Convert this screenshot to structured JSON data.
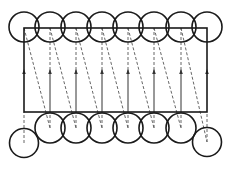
{
  "diagram": {
    "type": "circle-packing-path",
    "stroke_color": "#1a1a1a",
    "background": "#ffffff",
    "circle_radius": 15,
    "column_xs": [
      24,
      50,
      76,
      102,
      128,
      154,
      181,
      207
    ],
    "top_row_y": 27,
    "bottom_row": [
      {
        "x": 24,
        "y": 143
      },
      {
        "x": 50,
        "y": 128
      },
      {
        "x": 76,
        "y": 128
      },
      {
        "x": 102,
        "y": 128
      },
      {
        "x": 128,
        "y": 128
      },
      {
        "x": 154,
        "y": 128
      },
      {
        "x": 181,
        "y": 128
      },
      {
        "x": 207,
        "y": 142
      }
    ],
    "rectangle": {
      "x1": 24,
      "y1": 28,
      "x2": 207,
      "y2": 112
    },
    "arrow_y": 70
  }
}
